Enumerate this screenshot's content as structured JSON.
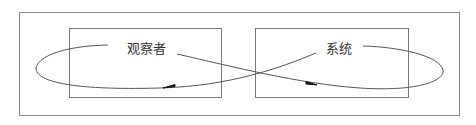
{
  "diagram": {
    "type": "observer-system loop",
    "colors": {
      "line": "#555555",
      "box": "#888888",
      "text": "#333333",
      "background": "#ffffff"
    },
    "nodes": [
      {
        "id": "observer",
        "label": "观察者"
      },
      {
        "id": "system",
        "label": "系统"
      }
    ],
    "edges": [
      {
        "from": "observer",
        "to": "system",
        "arrow": "arrowhead-right"
      },
      {
        "from": "system",
        "to": "observer",
        "arrow": "arrowhead-left"
      }
    ]
  }
}
